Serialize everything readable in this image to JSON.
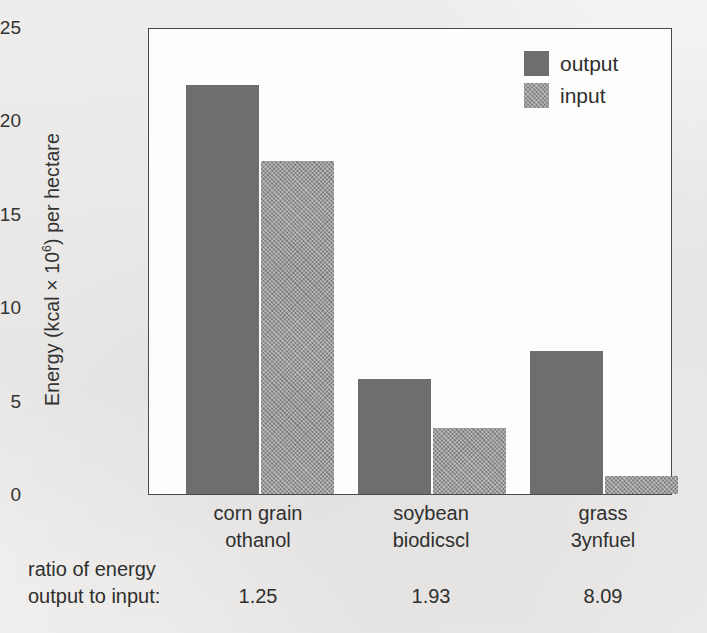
{
  "chart_data": {
    "type": "bar",
    "title": "",
    "xlabel": "",
    "ylabel": "Energy (kcal × 10⁶) per hectare",
    "ylabel_main": "Energy (kcal × 10",
    "ylabel_exp": "6",
    "ylabel_tail": ") per hectare",
    "ylim": [
      0,
      25
    ],
    "yticks": [
      0,
      5,
      10,
      15,
      20,
      25
    ],
    "ytick_labels": [
      "0",
      "5",
      "10",
      "15",
      "20",
      "25"
    ],
    "grid": false,
    "legend_position": "top-right",
    "categories": [
      "corn grain ethanol",
      "soybean biodiesel",
      "grass synfuel"
    ],
    "category_labels": [
      {
        "line1": "corn grain",
        "line2": "othanol"
      },
      {
        "line1": "soybean",
        "line2": "biodicscl"
      },
      {
        "line1": "grass",
        "line2": "3ynfuel"
      }
    ],
    "series": [
      {
        "name": "output",
        "values": [
          22.0,
          6.2,
          7.7
        ],
        "color": "#6e6e6e"
      },
      {
        "name": "input",
        "values": [
          17.9,
          3.55,
          0.95
        ],
        "color": "#7c7c7c"
      }
    ],
    "annotations": {
      "ratio_caption_line1": "ratio of energy",
      "ratio_caption_line2": "output to input:",
      "ratio_values": [
        "1.25",
        "1.93",
        "8.09"
      ]
    }
  },
  "legend": {
    "items": [
      {
        "label": "output",
        "swatch": "output"
      },
      {
        "label": "input",
        "swatch": "input"
      }
    ]
  },
  "colors": {
    "output_bar": "#6e6e6e",
    "input_bar": "#7c7c7c",
    "axis": "#4a4a4a",
    "text": "#2f2f2f",
    "page_background": "#f2f1ef",
    "plot_background": "#fdfdfc"
  }
}
